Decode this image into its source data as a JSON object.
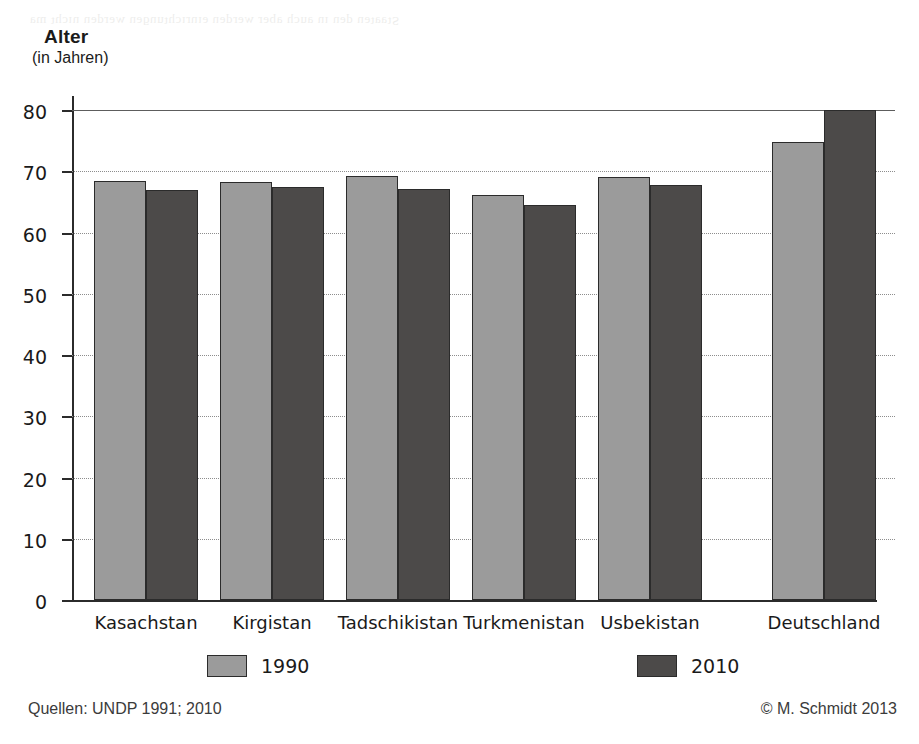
{
  "chart_data": {
    "type": "bar",
    "title": "Alter",
    "subtitle": "(in Jahren)",
    "ylabel": "Alter (in Jahren)",
    "xlabel": "",
    "ylim": [
      0,
      80
    ],
    "yticks": [
      0,
      10,
      20,
      30,
      40,
      50,
      60,
      70,
      80
    ],
    "ytick_labels": [
      "0",
      "10",
      "20",
      "30",
      "40",
      "50",
      "60",
      "70",
      "80"
    ],
    "grid": true,
    "legend_position": "bottom",
    "categories": [
      "Kasachstan",
      "Kirgistan",
      "Tadschikistan",
      "Turkmenistan",
      "Usbekistan",
      "Deutschland"
    ],
    "series": [
      {
        "name": "1990",
        "color": "#9b9b9b",
        "values": [
          68.4,
          68.3,
          69.2,
          66.1,
          69.0,
          74.8
        ]
      },
      {
        "name": "2010",
        "color": "#4c4a49",
        "values": [
          66.9,
          67.4,
          67.1,
          64.5,
          67.7,
          80.0
        ]
      }
    ],
    "source": "Quellen: UNDP 1991; 2010",
    "copyright": "© M. Schmidt 2013"
  },
  "axis_title": {
    "main": "Alter",
    "sub": "(in Jahren)"
  },
  "legend": {
    "items": [
      {
        "label": "1990"
      },
      {
        "label": "2010"
      }
    ]
  },
  "footer": {
    "source": "Quellen: UNDP 1991; 2010",
    "copyright": "© M. Schmidt 2013"
  },
  "artifact": {
    "bleed_text": "ɐɯ ʇɥɔıu uǝpɹǝʍ uǝƃunʇɥɔıɹuıǝ uǝpɹǝʍ ɹǝqɐ ɥɔnɐ uı uǝp uǝʇɐɐʇS"
  }
}
